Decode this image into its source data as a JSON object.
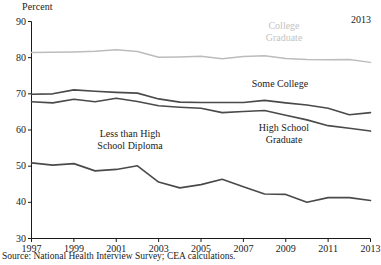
{
  "axis": {
    "unit_label": "Percent",
    "end_year_label": "2013",
    "y_ticks": [
      30,
      40,
      50,
      60,
      70,
      80,
      90
    ],
    "x_ticks": [
      1997,
      1999,
      2001,
      2003,
      2005,
      2007,
      2009,
      2011,
      2013
    ]
  },
  "labels": {
    "college_graduate_line1": "College",
    "college_graduate_line2": "Graduate",
    "some_college": "Some College",
    "high_school_line1": "High School",
    "high_school_line2": "Graduate",
    "less_than_hs_line1": "Less than High",
    "less_than_hs_line2": "School Diploma"
  },
  "source": "Source: National Health Interview Survey; CEA calculations.",
  "colors": {
    "college_graduate": "#bcbcbc",
    "some_college": "#4a4a4a",
    "high_school_graduate": "#4a4a4a",
    "less_than_high_school": "#4a4a4a",
    "axis": "#1a1a1a"
  },
  "chart_data": {
    "type": "line",
    "title": "",
    "subtitle": "",
    "xlabel": "",
    "ylabel": "Percent",
    "xlim": [
      1997,
      2013
    ],
    "ylim": [
      30,
      90
    ],
    "grid": false,
    "legend_position": "inline-annotations",
    "x": [
      1997,
      1998,
      1999,
      2000,
      2001,
      2002,
      2003,
      2004,
      2005,
      2006,
      2007,
      2008,
      2009,
      2010,
      2011,
      2012,
      2013
    ],
    "series": [
      {
        "name": "College Graduate",
        "color": "#bcbcbc",
        "values": [
          81.4,
          81.5,
          81.6,
          81.8,
          82.2,
          81.7,
          80.1,
          80.2,
          80.4,
          79.7,
          80.3,
          80.5,
          79.8,
          79.5,
          79.4,
          79.5,
          78.7
        ]
      },
      {
        "name": "Some College",
        "color": "#4a4a4a",
        "values": [
          69.9,
          70.0,
          71.1,
          70.7,
          70.4,
          70.2,
          68.6,
          67.7,
          67.6,
          67.6,
          67.6,
          68.2,
          67.5,
          66.9,
          66.0,
          64.2,
          64.8
        ]
      },
      {
        "name": "High School Graduate",
        "color": "#4a4a4a",
        "values": [
          67.8,
          67.5,
          68.5,
          67.8,
          68.8,
          67.9,
          66.7,
          66.3,
          66.0,
          64.8,
          65.1,
          65.4,
          64.1,
          62.8,
          61.2,
          60.5,
          59.7
        ]
      },
      {
        "name": "Less than High School Diploma",
        "color": "#4a4a4a",
        "values": [
          50.9,
          50.3,
          50.7,
          48.7,
          49.1,
          50.1,
          45.6,
          44.0,
          44.9,
          46.4,
          44.3,
          42.3,
          42.2,
          40.0,
          41.3,
          41.3,
          40.5
        ]
      }
    ]
  }
}
